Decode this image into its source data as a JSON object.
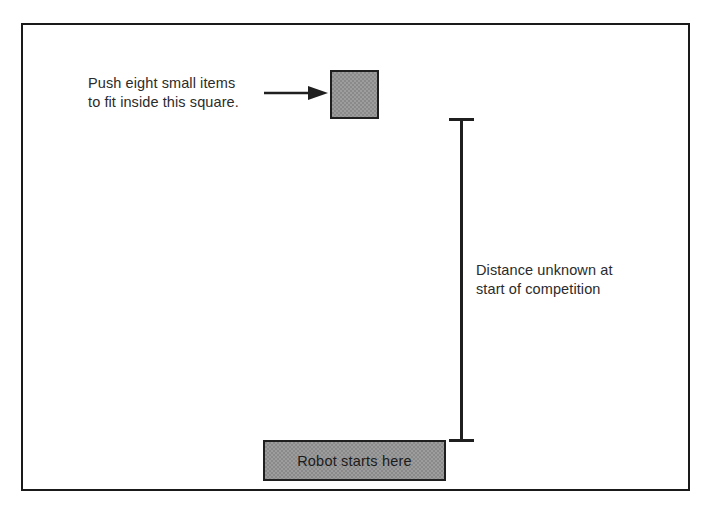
{
  "diagram": {
    "border_color": "#1a1a1a",
    "fill_color": "#8a8a8a",
    "ink_color": "#1f1f1f",
    "annotations": {
      "push_items": "Push eight small items\nto fit inside this square.",
      "distance_unknown": "Distance unknown at\nstart of competition",
      "robot_start": "Robot starts here"
    },
    "icons": {
      "arrow": "arrow-right-icon",
      "dimension": "dimension-line-icon"
    },
    "shapes": {
      "target_square_label": "target square",
      "robot_zone_label": "robot start zone"
    }
  }
}
